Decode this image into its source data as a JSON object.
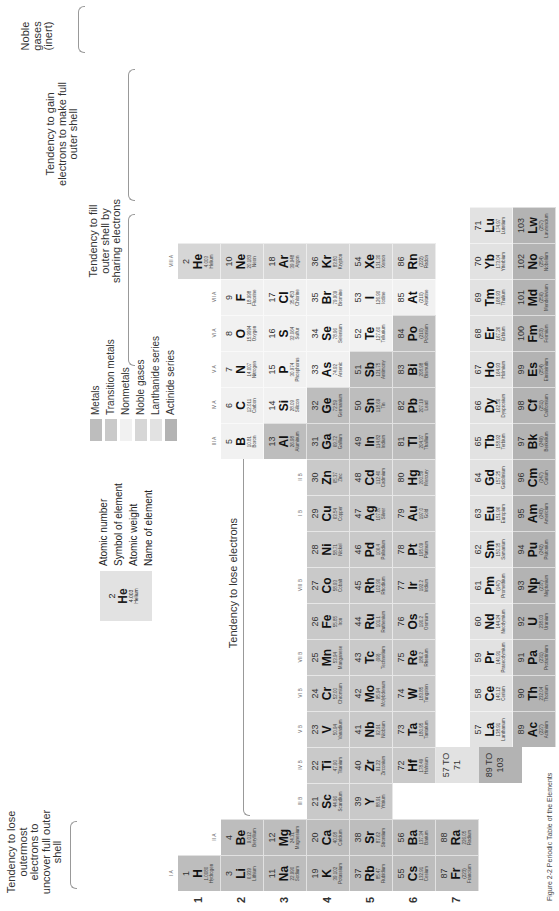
{
  "title": "Periodic Table of the Elements",
  "annotations": {
    "lose_outermost": "Tendency to lose outermost electrons to uncover full outer shell",
    "lose_electrons": "Tendency to lose electrons",
    "fill_sharing": "Tendency to fill outer shell by sharing electrons",
    "gain_electrons": "Tendency to gain electrons to make full outer shell",
    "noble_gases": "Noble gases (inert)"
  },
  "key": {
    "example": {
      "number": "2",
      "symbol": "He",
      "weight": "4.003",
      "name": "Helium"
    },
    "labels": [
      "Atomic number",
      "Symbol of element",
      "Atomic weight",
      "Name of element"
    ]
  },
  "legend": [
    {
      "label": "Metals",
      "color": "#bdbdbd"
    },
    {
      "label": "Transition metals",
      "color": "#c9c9c9"
    },
    {
      "label": "Nonmetals",
      "color": "#f1f1f1"
    },
    {
      "label": "Noble gases",
      "color": "#d6d6d6"
    },
    {
      "label": "Lanthanide series",
      "color": "#e2e2e2"
    },
    {
      "label": "Actinide series",
      "color": "#b3b3b3"
    }
  ],
  "periods": [
    "1",
    "2",
    "3",
    "4",
    "5",
    "6",
    "7"
  ],
  "groups": {
    "IA": "I A",
    "IIA": "II A",
    "IIIB": "III B",
    "IVB": "IV B",
    "VB": "V B",
    "VIB": "VI B",
    "VIIB": "VII B",
    "VIIIB": "VIII B",
    "IB": "I B",
    "IIB": "II B",
    "IIIA": "III A",
    "IVA": "IV A",
    "VA": "V A",
    "VIA": "VI A",
    "VIIA": "VII A",
    "VIIIA": "VIII A"
  },
  "ranges": {
    "lanthanides": "57 TO 71",
    "actinides": "89 TO 103"
  },
  "elements": [
    {
      "n": "1",
      "s": "H",
      "w": "1.0080",
      "name": "Hydrogen",
      "col": 1,
      "row": 1,
      "cat": "metal"
    },
    {
      "n": "2",
      "s": "He",
      "w": "4.003",
      "name": "Helium",
      "col": 18,
      "row": 1,
      "cat": "noble"
    },
    {
      "n": "3",
      "s": "Li",
      "w": "6.939",
      "name": "Lithium",
      "col": 1,
      "row": 2,
      "cat": "metal"
    },
    {
      "n": "4",
      "s": "Be",
      "w": "9.012",
      "name": "Beryllium",
      "col": 2,
      "row": 2,
      "cat": "metal"
    },
    {
      "n": "5",
      "s": "B",
      "w": "10.81",
      "name": "Boron",
      "col": 13,
      "row": 2,
      "cat": "nonmetal"
    },
    {
      "n": "6",
      "s": "C",
      "w": "12.011",
      "name": "Carbon",
      "col": 14,
      "row": 2,
      "cat": "nonmetal"
    },
    {
      "n": "7",
      "s": "N",
      "w": "14.007",
      "name": "Nitrogen",
      "col": 15,
      "row": 2,
      "cat": "nonmetal"
    },
    {
      "n": "8",
      "s": "O",
      "w": "15.9994",
      "name": "Oxygen",
      "col": 16,
      "row": 2,
      "cat": "nonmetal"
    },
    {
      "n": "9",
      "s": "F",
      "w": "18.998",
      "name": "Fluorine",
      "col": 17,
      "row": 2,
      "cat": "nonmetal"
    },
    {
      "n": "10",
      "s": "Ne",
      "w": "20.183",
      "name": "Neon",
      "col": 18,
      "row": 2,
      "cat": "noble"
    },
    {
      "n": "11",
      "s": "Na",
      "w": "22.990",
      "name": "Sodium",
      "col": 1,
      "row": 3,
      "cat": "metal"
    },
    {
      "n": "12",
      "s": "Mg",
      "w": "24.31",
      "name": "Magnesium",
      "col": 2,
      "row": 3,
      "cat": "metal"
    },
    {
      "n": "13",
      "s": "Al",
      "w": "26.98",
      "name": "Aluminum",
      "col": 13,
      "row": 3,
      "cat": "metal"
    },
    {
      "n": "14",
      "s": "Si",
      "w": "28.09",
      "name": "Silicon",
      "col": 14,
      "row": 3,
      "cat": "nonmetal"
    },
    {
      "n": "15",
      "s": "P",
      "w": "30.974",
      "name": "Phosphorus",
      "col": 15,
      "row": 3,
      "cat": "nonmetal"
    },
    {
      "n": "16",
      "s": "S",
      "w": "32.064",
      "name": "Sulfur",
      "col": 16,
      "row": 3,
      "cat": "nonmetal"
    },
    {
      "n": "17",
      "s": "Cl",
      "w": "35.453",
      "name": "Chlorine",
      "col": 17,
      "row": 3,
      "cat": "nonmetal"
    },
    {
      "n": "18",
      "s": "Ar",
      "w": "39.948",
      "name": "Argon",
      "col": 18,
      "row": 3,
      "cat": "noble"
    },
    {
      "n": "19",
      "s": "K",
      "w": "39.102",
      "name": "Potassium",
      "col": 1,
      "row": 4,
      "cat": "metal"
    },
    {
      "n": "20",
      "s": "Ca",
      "w": "40.08",
      "name": "Calcium",
      "col": 2,
      "row": 4,
      "cat": "metal"
    },
    {
      "n": "21",
      "s": "Sc",
      "w": "44.96",
      "name": "Scandium",
      "col": 3,
      "row": 4,
      "cat": "trans"
    },
    {
      "n": "22",
      "s": "Ti",
      "w": "47.90",
      "name": "Titanium",
      "col": 4,
      "row": 4,
      "cat": "trans"
    },
    {
      "n": "23",
      "s": "V",
      "w": "50.94",
      "name": "Vanadium",
      "col": 5,
      "row": 4,
      "cat": "trans"
    },
    {
      "n": "24",
      "s": "Cr",
      "w": "52.00",
      "name": "Chromium",
      "col": 6,
      "row": 4,
      "cat": "trans"
    },
    {
      "n": "25",
      "s": "Mn",
      "w": "53.94",
      "name": "Manganese",
      "col": 7,
      "row": 4,
      "cat": "trans"
    },
    {
      "n": "26",
      "s": "Fe",
      "w": "55.85",
      "name": "Iron",
      "col": 8,
      "row": 4,
      "cat": "trans"
    },
    {
      "n": "27",
      "s": "Co",
      "w": "58.93",
      "name": "Cobalt",
      "col": 9,
      "row": 4,
      "cat": "trans"
    },
    {
      "n": "28",
      "s": "Ni",
      "w": "58.71",
      "name": "Nickel",
      "col": 10,
      "row": 4,
      "cat": "trans"
    },
    {
      "n": "29",
      "s": "Cu",
      "w": "63.54",
      "name": "Copper",
      "col": 11,
      "row": 4,
      "cat": "trans"
    },
    {
      "n": "30",
      "s": "Zn",
      "w": "65.37",
      "name": "Zinc",
      "col": 12,
      "row": 4,
      "cat": "trans"
    },
    {
      "n": "31",
      "s": "Ga",
      "w": "69.72",
      "name": "Gallium",
      "col": 13,
      "row": 4,
      "cat": "metal"
    },
    {
      "n": "32",
      "s": "Ge",
      "w": "72.59",
      "name": "Germanium",
      "col": 14,
      "row": 4,
      "cat": "metal"
    },
    {
      "n": "33",
      "s": "As",
      "w": "74.92",
      "name": "Arsenic",
      "col": 15,
      "row": 4,
      "cat": "nonmetal"
    },
    {
      "n": "34",
      "s": "Se",
      "w": "78.96",
      "name": "Selenium",
      "col": 16,
      "row": 4,
      "cat": "nonmetal"
    },
    {
      "n": "35",
      "s": "Br",
      "w": "79.909",
      "name": "Bromine",
      "col": 17,
      "row": 4,
      "cat": "nonmetal"
    },
    {
      "n": "36",
      "s": "Kr",
      "w": "83.80",
      "name": "Krypton",
      "col": 18,
      "row": 4,
      "cat": "noble"
    },
    {
      "n": "37",
      "s": "Rb",
      "w": "85.47",
      "name": "Rubidium",
      "col": 1,
      "row": 5,
      "cat": "metal"
    },
    {
      "n": "38",
      "s": "Sr",
      "w": "87.62",
      "name": "Strontium",
      "col": 2,
      "row": 5,
      "cat": "metal"
    },
    {
      "n": "39",
      "s": "Y",
      "w": "88.91",
      "name": "Yttrium",
      "col": 3,
      "row": 5,
      "cat": "trans"
    },
    {
      "n": "40",
      "s": "Zr",
      "w": "91.22",
      "name": "Zirconium",
      "col": 4,
      "row": 5,
      "cat": "trans"
    },
    {
      "n": "41",
      "s": "Nb",
      "w": "92.91",
      "name": "Niobium",
      "col": 5,
      "row": 5,
      "cat": "trans"
    },
    {
      "n": "42",
      "s": "Mo",
      "w": "95.94",
      "name": "Molybdenum",
      "col": 6,
      "row": 5,
      "cat": "trans"
    },
    {
      "n": "43",
      "s": "Tc",
      "w": "(99)",
      "name": "Technetium",
      "col": 7,
      "row": 5,
      "cat": "trans"
    },
    {
      "n": "44",
      "s": "Ru",
      "w": "101.1",
      "name": "Ruthenium",
      "col": 8,
      "row": 5,
      "cat": "trans"
    },
    {
      "n": "45",
      "s": "Rh",
      "w": "102.90",
      "name": "Rhodium",
      "col": 9,
      "row": 5,
      "cat": "trans"
    },
    {
      "n": "46",
      "s": "Pd",
      "w": "106.4",
      "name": "Palladium",
      "col": 10,
      "row": 5,
      "cat": "trans"
    },
    {
      "n": "47",
      "s": "Ag",
      "w": "107.87",
      "name": "Silver",
      "col": 11,
      "row": 5,
      "cat": "trans"
    },
    {
      "n": "48",
      "s": "Cd",
      "w": "112.40",
      "name": "Cadmium",
      "col": 12,
      "row": 5,
      "cat": "trans"
    },
    {
      "n": "49",
      "s": "In",
      "w": "114.82",
      "name": "Indium",
      "col": 13,
      "row": 5,
      "cat": "metal"
    },
    {
      "n": "50",
      "s": "Sn",
      "w": "118.69",
      "name": "Tin",
      "col": 14,
      "row": 5,
      "cat": "metal"
    },
    {
      "n": "51",
      "s": "Sb",
      "w": "121.75",
      "name": "Antimony",
      "col": 15,
      "row": 5,
      "cat": "metal"
    },
    {
      "n": "52",
      "s": "Te",
      "w": "127.60",
      "name": "Tellurium",
      "col": 16,
      "row": 5,
      "cat": "nonmetal"
    },
    {
      "n": "53",
      "s": "I",
      "w": "126.90",
      "name": "Iodine",
      "col": 17,
      "row": 5,
      "cat": "nonmetal"
    },
    {
      "n": "54",
      "s": "Xe",
      "w": "131.30",
      "name": "Xenon",
      "col": 18,
      "row": 5,
      "cat": "noble"
    },
    {
      "n": "55",
      "s": "Cs",
      "w": "132.91",
      "name": "Cesium",
      "col": 1,
      "row": 6,
      "cat": "metal"
    },
    {
      "n": "56",
      "s": "Ba",
      "w": "137.34",
      "name": "Barium",
      "col": 2,
      "row": 6,
      "cat": "metal"
    },
    {
      "n": "72",
      "s": "Hf",
      "w": "178.49",
      "name": "Hafnium",
      "col": 4,
      "row": 6,
      "cat": "trans"
    },
    {
      "n": "73",
      "s": "Ta",
      "w": "180.95",
      "name": "Tantalum",
      "col": 5,
      "row": 6,
      "cat": "trans"
    },
    {
      "n": "74",
      "s": "W",
      "w": "183.85",
      "name": "Tungsten",
      "col": 6,
      "row": 6,
      "cat": "trans"
    },
    {
      "n": "75",
      "s": "Re",
      "w": "186.2",
      "name": "Rhenium",
      "col": 7,
      "row": 6,
      "cat": "trans"
    },
    {
      "n": "76",
      "s": "Os",
      "w": "190.2",
      "name": "Osmium",
      "col": 8,
      "row": 6,
      "cat": "trans"
    },
    {
      "n": "77",
      "s": "Ir",
      "w": "192.2",
      "name": "Iridium",
      "col": 9,
      "row": 6,
      "cat": "trans"
    },
    {
      "n": "78",
      "s": "Pt",
      "w": "195.09",
      "name": "Platinum",
      "col": 10,
      "row": 6,
      "cat": "trans"
    },
    {
      "n": "79",
      "s": "Au",
      "w": "197.0",
      "name": "Gold",
      "col": 11,
      "row": 6,
      "cat": "trans"
    },
    {
      "n": "80",
      "s": "Hg",
      "w": "200.59",
      "name": "Mercury",
      "col": 12,
      "row": 6,
      "cat": "trans"
    },
    {
      "n": "81",
      "s": "Tl",
      "w": "204.37",
      "name": "Thallium",
      "col": 13,
      "row": 6,
      "cat": "metal"
    },
    {
      "n": "82",
      "s": "Pb",
      "w": "207.19",
      "name": "Lead",
      "col": 14,
      "row": 6,
      "cat": "metal"
    },
    {
      "n": "83",
      "s": "Bi",
      "w": "208.98",
      "name": "Bismuth",
      "col": 15,
      "row": 6,
      "cat": "metal"
    },
    {
      "n": "84",
      "s": "Po",
      "w": "(210)",
      "name": "Polonium",
      "col": 16,
      "row": 6,
      "cat": "metal"
    },
    {
      "n": "85",
      "s": "At",
      "w": "(210)",
      "name": "Astatine",
      "col": 17,
      "row": 6,
      "cat": "nonmetal"
    },
    {
      "n": "86",
      "s": "Rn",
      "w": "(222)",
      "name": "Radon",
      "col": 18,
      "row": 6,
      "cat": "noble"
    },
    {
      "n": "87",
      "s": "Fr",
      "w": "(223)",
      "name": "Francium",
      "col": 1,
      "row": 7,
      "cat": "metal"
    },
    {
      "n": "88",
      "s": "Ra",
      "w": "226.05",
      "name": "Radium",
      "col": 2,
      "row": 7,
      "cat": "metal"
    }
  ],
  "lanthanides": [
    {
      "n": "57",
      "s": "La",
      "w": "138.91",
      "name": "Lanthanum"
    },
    {
      "n": "58",
      "s": "Ce",
      "w": "140.12",
      "name": "Cerium"
    },
    {
      "n": "59",
      "s": "Pr",
      "w": "140.91",
      "name": "Praseodymium"
    },
    {
      "n": "60",
      "s": "Nd",
      "w": "144.24",
      "name": "Neodymium"
    },
    {
      "n": "61",
      "s": "Pm",
      "w": "(147)",
      "name": "Promethium"
    },
    {
      "n": "62",
      "s": "Sm",
      "w": "150.35",
      "name": "Samarium"
    },
    {
      "n": "63",
      "s": "Eu",
      "w": "151.96",
      "name": "Europium"
    },
    {
      "n": "64",
      "s": "Gd",
      "w": "157.25",
      "name": "Gadolinium"
    },
    {
      "n": "65",
      "s": "Tb",
      "w": "158.92",
      "name": "Terbium"
    },
    {
      "n": "66",
      "s": "Dy",
      "w": "162.50",
      "name": "Dysprosium"
    },
    {
      "n": "67",
      "s": "Ho",
      "w": "164.93",
      "name": "Holmium"
    },
    {
      "n": "68",
      "s": "Er",
      "w": "167.26",
      "name": "Erbium"
    },
    {
      "n": "69",
      "s": "Tm",
      "w": "168.93",
      "name": "Thulium"
    },
    {
      "n": "70",
      "s": "Yb",
      "w": "173.04",
      "name": "Ytterbium"
    },
    {
      "n": "71",
      "s": "Lu",
      "w": "174.97",
      "name": "Lutetium"
    }
  ],
  "actinides": [
    {
      "n": "89",
      "s": "Ac",
      "w": "(227)",
      "name": "Actinium"
    },
    {
      "n": "90",
      "s": "Th",
      "w": "232.04",
      "name": "Thorium"
    },
    {
      "n": "91",
      "s": "Pa",
      "w": "(231)",
      "name": "Protactinium"
    },
    {
      "n": "92",
      "s": "U",
      "w": "238.03",
      "name": "Uranium"
    },
    {
      "n": "93",
      "s": "Np",
      "w": "(237)",
      "name": "Neptunium"
    },
    {
      "n": "94",
      "s": "Pu",
      "w": "(242)",
      "name": "Plutonium"
    },
    {
      "n": "95",
      "s": "Am",
      "w": "(243)",
      "name": "Americium"
    },
    {
      "n": "96",
      "s": "Cm",
      "w": "(247)",
      "name": "Curium"
    },
    {
      "n": "97",
      "s": "Bk",
      "w": "(249)",
      "name": "Berkelium"
    },
    {
      "n": "98",
      "s": "Cf",
      "w": "(251)",
      "name": "Californium"
    },
    {
      "n": "99",
      "s": "Es",
      "w": "(254)",
      "name": "Einsteinium"
    },
    {
      "n": "100",
      "s": "Fm",
      "w": "(253)",
      "name": "Fermium"
    },
    {
      "n": "101",
      "s": "Md",
      "w": "(256)",
      "name": "Mendelevium"
    },
    {
      "n": "102",
      "s": "No",
      "w": "(254)",
      "name": "Nobelium"
    },
    {
      "n": "103",
      "s": "Lw",
      "w": "(257)",
      "name": "Lawrencium"
    }
  ],
  "caption": "Figure 2-2 Periodic Table of the Elements"
}
